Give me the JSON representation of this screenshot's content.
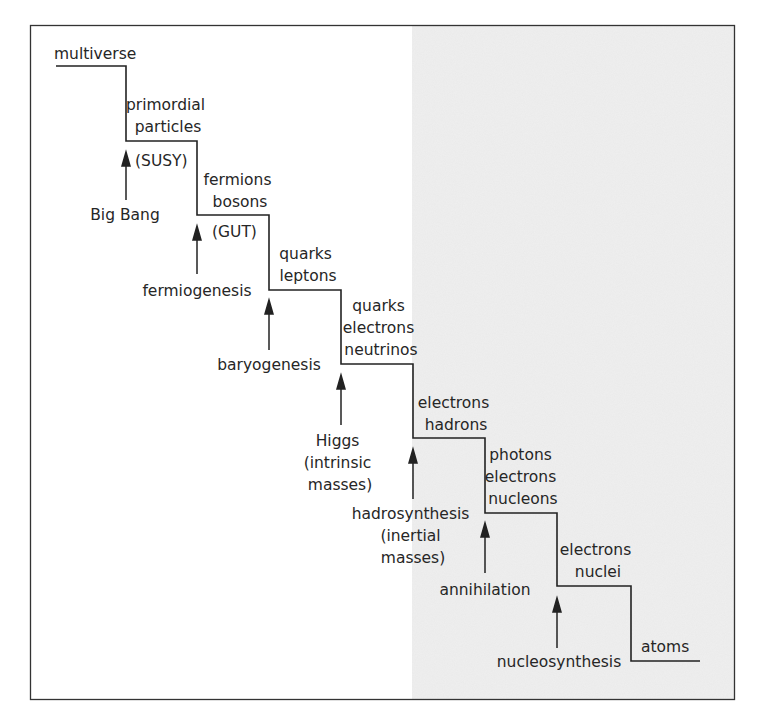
{
  "diagram": {
    "type": "staircase-timeline",
    "frame": {
      "border_color": "#333333",
      "background": "#ffffff"
    },
    "shaded_region": {
      "color": "#efefef",
      "description": "right half shaded"
    },
    "steps": [
      {
        "id": "multiverse",
        "lines": [
          "multiverse"
        ]
      },
      {
        "id": "primordial-particles",
        "lines": [
          "primordial",
          "particles"
        ]
      },
      {
        "id": "fermions-bosons",
        "lines": [
          "fermions",
          "bosons"
        ]
      },
      {
        "id": "quarks-leptons",
        "lines": [
          "quarks",
          "leptons"
        ]
      },
      {
        "id": "quarks-electrons-neutrinos",
        "lines": [
          "quarks",
          "electrons",
          "neutrinos"
        ]
      },
      {
        "id": "electrons-hadrons",
        "lines": [
          "electrons",
          "hadrons"
        ]
      },
      {
        "id": "photons-electrons-nucleons",
        "lines": [
          "photons",
          "electrons",
          "nucleons"
        ]
      },
      {
        "id": "electrons-nuclei",
        "lines": [
          "electrons",
          "nuclei"
        ]
      },
      {
        "id": "atoms",
        "lines": [
          "atoms"
        ]
      }
    ],
    "transitions": [
      {
        "id": "big-bang",
        "lines": [
          "Big Bang"
        ],
        "tag": "(SUSY)"
      },
      {
        "id": "fermiogenesis",
        "lines": [
          "fermiogenesis"
        ],
        "tag": "(GUT)"
      },
      {
        "id": "baryogenesis",
        "lines": [
          "baryogenesis"
        ],
        "tag": ""
      },
      {
        "id": "higgs",
        "lines": [
          "Higgs",
          "(intrinsic",
          "masses)"
        ],
        "tag": ""
      },
      {
        "id": "hadrosynthesis",
        "lines": [
          "hadrosynthesis",
          "(inertial",
          "masses)"
        ],
        "tag": ""
      },
      {
        "id": "annihilation",
        "lines": [
          "annihilation"
        ],
        "tag": ""
      },
      {
        "id": "nucleosynthesis",
        "lines": [
          "nucleosynthesis"
        ],
        "tag": ""
      }
    ]
  }
}
